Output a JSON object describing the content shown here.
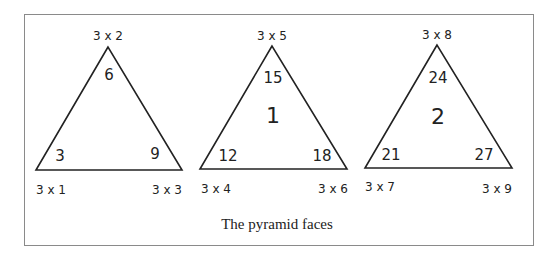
{
  "caption": "The pyramid faces",
  "faces": [
    {
      "center_label": "",
      "top_label": "3 x 2",
      "left_label": "3 x 1",
      "right_label": "3 x 3",
      "top_value": "6",
      "left_value": "3",
      "right_value": "9"
    },
    {
      "center_label": "1",
      "top_label": "3 x 5",
      "left_label": "3 x 4",
      "right_label": "3 x 6",
      "top_value": "15",
      "left_value": "12",
      "right_value": "18"
    },
    {
      "center_label": "2",
      "top_label": "3 x 8",
      "left_label": "3 x 7",
      "right_label": "3 x 9",
      "top_value": "24",
      "left_value": "21",
      "right_value": "27"
    }
  ],
  "colors": {
    "line": "#222222",
    "frame": "#8a8a8a"
  }
}
